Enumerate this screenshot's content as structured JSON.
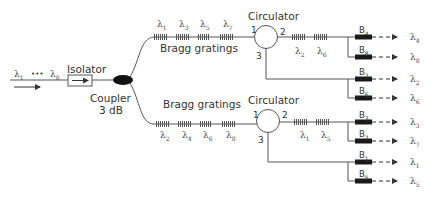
{
  "input": {
    "label_first": "λ",
    "label_first_sub": "1",
    "ellipsis": "•••",
    "label_last": "λ",
    "label_last_sub": "8"
  },
  "isolator": {
    "label": "Isolator"
  },
  "coupler": {
    "label_line1": "Coupler",
    "label_line2": "3 dB"
  },
  "upper_branch": {
    "gratings_label": "Bragg gratings",
    "gratings": [
      {
        "sym": "λ",
        "sub": "1"
      },
      {
        "sym": "λ",
        "sub": "3"
      },
      {
        "sym": "λ",
        "sub": "5"
      },
      {
        "sym": "λ",
        "sub": "7"
      }
    ],
    "circulator": {
      "label": "Circulator",
      "port1": "1",
      "port2": "2",
      "port3": "3"
    },
    "port2_gratings": [
      {
        "sym": "λ",
        "sub": "2"
      },
      {
        "sym": "λ",
        "sub": "6"
      }
    ],
    "outputs": [
      {
        "filter": "B",
        "filter_sub": "4",
        "sym": "λ",
        "sub": "4"
      },
      {
        "filter": "B",
        "filter_sub": "8",
        "sym": "λ",
        "sub": "8"
      },
      {
        "filter": "B",
        "filter_sub": "2",
        "sym": "λ",
        "sub": "2"
      },
      {
        "filter": "B",
        "filter_sub": "6",
        "sym": "λ",
        "sub": "6"
      }
    ]
  },
  "lower_branch": {
    "gratings_label": "Bragg gratings",
    "gratings": [
      {
        "sym": "λ",
        "sub": "2"
      },
      {
        "sym": "λ",
        "sub": "4"
      },
      {
        "sym": "λ",
        "sub": "6"
      },
      {
        "sym": "λ",
        "sub": "8"
      }
    ],
    "circulator": {
      "label": "Circulator",
      "port1": "1",
      "port2": "2",
      "port3": "3"
    },
    "port2_gratings": [
      {
        "sym": "λ",
        "sub": "1"
      },
      {
        "sym": "λ",
        "sub": "5"
      }
    ],
    "outputs": [
      {
        "filter": "B",
        "filter_sub": "3",
        "sym": "λ",
        "sub": "3"
      },
      {
        "filter": "B",
        "filter_sub": "7",
        "sym": "λ",
        "sub": "7"
      },
      {
        "filter": "B",
        "filter_sub": "1",
        "sym": "λ",
        "sub": "1"
      },
      {
        "filter": "B",
        "filter_sub": "5",
        "sym": "λ",
        "sub": "5"
      }
    ]
  },
  "colors": {
    "line": "#555555",
    "filter": "#1a1a1a",
    "coupler": "#111111",
    "grating": "#666666"
  }
}
